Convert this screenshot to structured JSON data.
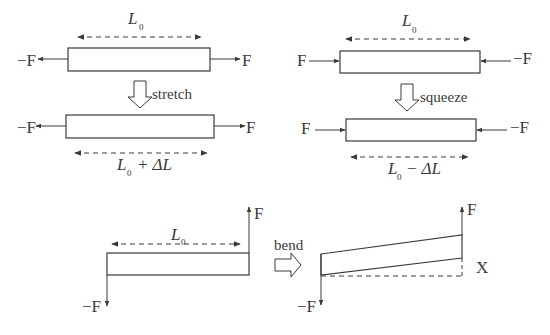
{
  "diagram": {
    "stretch": {
      "top_length_label": "L",
      "top_length_sub": "0",
      "left_force": "−F",
      "right_force": "F",
      "action_label": "stretch",
      "bottom_left_force": "−F",
      "bottom_right_force": "F",
      "bottom_length_label": "L",
      "bottom_length_sub": "0",
      "bottom_length_suffix": "+ ΔL"
    },
    "squeeze": {
      "top_length_label": "L",
      "top_length_sub": "0",
      "left_force": "F",
      "right_force": "−F",
      "action_label": "squeeze",
      "bottom_left_force": "F",
      "bottom_right_force": "−F",
      "bottom_length_label": "L",
      "bottom_length_sub": "0",
      "bottom_length_suffix": "− ΔL"
    },
    "bend": {
      "length_label": "L",
      "length_sub": "0",
      "before_up_force": "F",
      "before_down_force": "−F",
      "action_label": "bend",
      "after_up_force": "F",
      "after_down_force": "−F",
      "deflection_label": "X"
    },
    "colors": {
      "line": "#3a3a3a",
      "background": "#ffffff"
    }
  }
}
